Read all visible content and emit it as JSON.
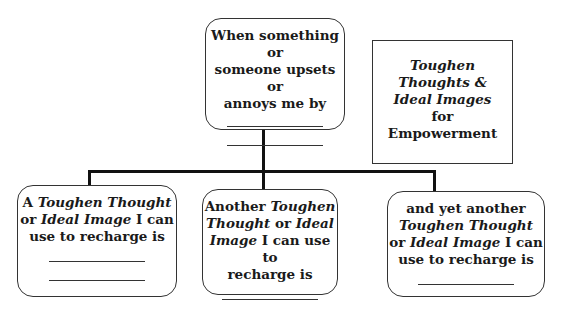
{
  "top_box": {
    "text": "When something or someone upsets or annoys me by",
    "line1": "When something or",
    "line2": "someone upsets or",
    "line3": "annoys me by",
    "blanks": 2
  },
  "title_box": {
    "line1": "Toughen",
    "line2": "Thoughts &",
    "line3": "Ideal Images",
    "line4": "for",
    "line5": "Empowerment"
  },
  "children": [
    {
      "line1_plain": "A ",
      "line1_italic": "Toughen Thought",
      "line2_plain_a": "or ",
      "line2_italic": "Ideal Image",
      "line2_plain_b": " I can",
      "line3": "use to recharge is",
      "blanks": 2
    },
    {
      "line1_plain": "Another ",
      "line1_italic": "Toughen",
      "line2_italic": "Thought",
      "line2_plain": " or ",
      "line2_italic_b": "Ideal",
      "line3_italic": "Image",
      "line3_plain": " I can use to",
      "line4": "recharge is",
      "blanks": 1
    },
    {
      "line1": "and yet another",
      "line2_italic": "Toughen Thought",
      "line3_plain_a": "or ",
      "line3_italic": "Ideal Image",
      "line3_plain_b": " I can",
      "line4": "use to recharge is",
      "blanks": 1
    }
  ]
}
